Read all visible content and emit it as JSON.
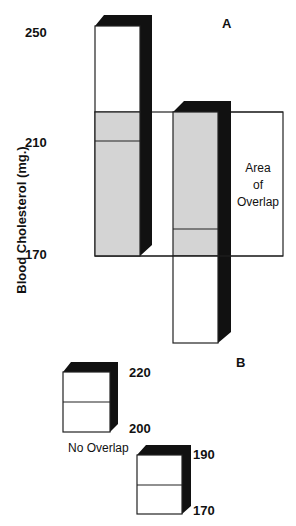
{
  "diagram": {
    "y_axis_label": "Blood Cholesterol (mg.)",
    "y_ticks": [
      "250",
      "210",
      "170"
    ],
    "label_A": "A",
    "label_B": "B",
    "overlap_label_line1": "Area",
    "overlap_label_line2": "of",
    "overlap_label_line3": "Overlap",
    "no_overlap_label": "No Overlap",
    "box1_top_value": "220",
    "box1_bottom_value": "200",
    "box2_top_value": "190",
    "box2_bottom_value": "170",
    "colors": {
      "overlap_fill": "#d4d4d4",
      "bar_side": "#111111",
      "outline": "#222222",
      "background": "#ffffff"
    }
  }
}
